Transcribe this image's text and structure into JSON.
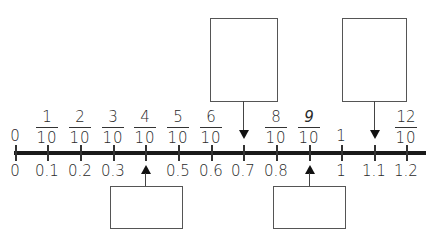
{
  "number_line": {
    "start": 0,
    "end": 1.2,
    "step": 0.1,
    "line_color": "#1a1a1a"
  },
  "top_labels": [
    {
      "type": "whole",
      "value": "0"
    },
    {
      "type": "fraction",
      "numerator": "1",
      "denominator": "10"
    },
    {
      "type": "fraction",
      "numerator": "2",
      "denominator": "10"
    },
    {
      "type": "fraction",
      "numerator": "3",
      "denominator": "10"
    },
    {
      "type": "fraction",
      "numerator": "4",
      "denominator": "10"
    },
    {
      "type": "fraction",
      "numerator": "5",
      "denominator": "10"
    },
    {
      "type": "fraction",
      "numerator": "6",
      "denominator": "10"
    },
    {
      "type": "blank"
    },
    {
      "type": "fraction",
      "numerator": "8",
      "denominator": "10"
    },
    {
      "type": "fraction",
      "numerator": "9",
      "denominator": "10",
      "italic": true
    },
    {
      "type": "whole",
      "value": "1"
    },
    {
      "type": "blank"
    },
    {
      "type": "fraction",
      "numerator": "12",
      "denominator": "10"
    }
  ],
  "bottom_labels": [
    "0",
    "0.1",
    "0.2",
    "0.3",
    "",
    "0.5",
    "0.6",
    "0.7",
    "0.8",
    "",
    "1",
    "1.1",
    "1.2"
  ],
  "answer_boxes": {
    "top": [
      {
        "points_to": "0.7 (fraction missing)",
        "value": ""
      },
      {
        "points_to": "1.1 (fraction missing)",
        "value": ""
      }
    ],
    "bottom": [
      {
        "points_to": "0.4 (decimal missing)",
        "value": ""
      },
      {
        "points_to": "0.9 (decimal missing)",
        "value": ""
      }
    ]
  }
}
